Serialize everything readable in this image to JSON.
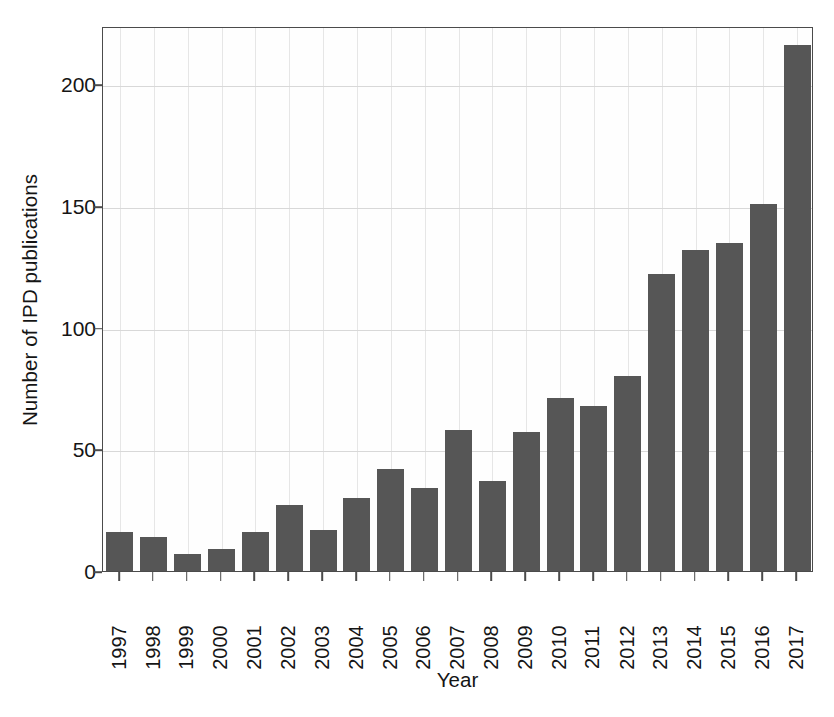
{
  "chart_data": {
    "type": "bar",
    "title": "",
    "xlabel": "Year",
    "ylabel": "Number of IPD publications",
    "categories": [
      "1997",
      "1998",
      "1999",
      "2000",
      "2001",
      "2002",
      "2003",
      "2004",
      "2005",
      "2006",
      "2007",
      "2008",
      "2009",
      "2010",
      "2011",
      "2012",
      "2013",
      "2014",
      "2015",
      "2016",
      "2017"
    ],
    "values": [
      16,
      14,
      7,
      9,
      16,
      27,
      17,
      30,
      42,
      34,
      58,
      37,
      57,
      71,
      68,
      80,
      122,
      132,
      135,
      151,
      216
    ],
    "ylim": [
      0,
      224
    ],
    "xlim_note": "21 categorical bars, 1997 through 2017",
    "yticks": [
      0,
      50,
      100,
      150,
      200
    ],
    "ytick_labels": [
      "0",
      "50",
      "100",
      "150",
      "200"
    ],
    "grid": "horizontal and vertical light gridlines",
    "legend": "none",
    "bar_color": "#565656",
    "frame_color": "#4b4b4b",
    "gridline_color": "#d8d8d8",
    "xtick_label_rotation": "90 degrees"
  }
}
